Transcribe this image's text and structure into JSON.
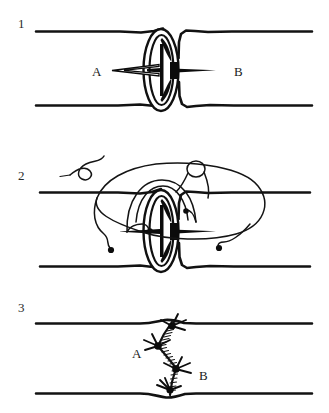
{
  "figure": {
    "background_color": "#ffffff",
    "ink_color": "#121212",
    "width": 329,
    "height": 413
  },
  "panels": [
    {
      "number": "1",
      "caption_labels": {
        "left": "A",
        "right": "B"
      },
      "description": "Two transected vessel ends approximated; vessel A on the left shown with everted cuff and opened lumen, vessel B on the right with tapered lumen",
      "geometry": {
        "top_wall_y": 32,
        "bottom_wall_y": 105,
        "centerline_y": 70,
        "gap_center_x": 172,
        "left_wall_start_x": 36,
        "right_wall_end_x": 312
      }
    },
    {
      "number": "2",
      "caption_labels": {},
      "description": "Suture threads passed through both vessel edges, needles and free thread ends looping around the anastomosis; knot being formed at upper left",
      "geometry": {
        "top_wall_y": 192,
        "bottom_wall_y": 265,
        "centerline_y": 228,
        "gap_center_x": 172
      }
    },
    {
      "number": "3",
      "caption_labels": {
        "left": "A",
        "right": "B"
      },
      "description": "Completed anastomosis with continuous zigzag suture line and three tied knots joining the two vessel ends",
      "geometry": {
        "top_wall_y": 323,
        "bottom_wall_y": 394,
        "centerline_y": 358,
        "suture_path_x": 172
      }
    }
  ],
  "annotations": {
    "panel1_label_a_x": 97,
    "panel1_label_a_y": 72,
    "panel1_label_b_x": 237,
    "panel1_label_b_y": 72,
    "panel3_label_a_x": 139,
    "panel3_label_a_y": 354,
    "panel3_label_b_x": 204,
    "panel3_label_b_y": 378
  }
}
